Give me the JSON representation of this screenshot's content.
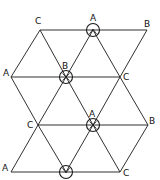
{
  "diagram": {
    "title": "",
    "type": "triangular-lattice",
    "nodes": [
      {
        "id": "r1a",
        "label": "C",
        "x": 40,
        "y": 30,
        "lx": 35,
        "ly": 24,
        "circled": false
      },
      {
        "id": "r1b",
        "label": "A",
        "x": 93,
        "y": 30,
        "lx": 90,
        "ly": 20,
        "circled": true,
        "mark": "caret-up"
      },
      {
        "id": "r1c",
        "label": "B",
        "x": 147,
        "y": 30,
        "lx": 145,
        "ly": 26,
        "circled": false
      },
      {
        "id": "r2a",
        "label": "A",
        "x": 11,
        "y": 77,
        "lx": 4,
        "ly": 74,
        "circled": false
      },
      {
        "id": "r2b",
        "label": "B",
        "x": 66,
        "y": 77,
        "lx": 63,
        "ly": 68,
        "circled": true,
        "mark": "cross"
      },
      {
        "id": "r2c",
        "label": "C",
        "x": 120,
        "y": 77,
        "lx": 124,
        "ly": 80,
        "circled": false
      },
      {
        "id": "r3a",
        "label": "C",
        "x": 38,
        "y": 125,
        "lx": 28,
        "ly": 128,
        "circled": false
      },
      {
        "id": "r3b",
        "label": "A",
        "x": 93,
        "y": 125,
        "lx": 90,
        "ly": 117,
        "circled": true,
        "mark": "cross"
      },
      {
        "id": "r3c",
        "label": "B",
        "x": 148,
        "y": 125,
        "lx": 149,
        "ly": 123,
        "circled": false
      },
      {
        "id": "r4a",
        "label": "A",
        "x": 11,
        "y": 172,
        "lx": 3,
        "ly": 170,
        "circled": false
      },
      {
        "id": "r4b",
        "label": "",
        "x": 66,
        "y": 172,
        "lx": 0,
        "ly": 0,
        "circled": true,
        "mark": "caret-down"
      },
      {
        "id": "r4c",
        "label": "C",
        "x": 120,
        "y": 172,
        "lx": 124,
        "ly": 175,
        "circled": false
      }
    ],
    "labels": {
      "r1a": "C",
      "r1b": "A",
      "r1c": "B",
      "r2a": "A",
      "r2b": "B",
      "r2c": "C",
      "r3a": "C",
      "r3b": "A",
      "r3c": "B",
      "r4a": "A",
      "r4c": "C"
    },
    "edges": [
      [
        "r1a",
        "r1c"
      ],
      [
        "r2a",
        "r2c"
      ],
      [
        "r3a",
        "r3c"
      ],
      [
        "r4a",
        "r4c"
      ],
      [
        "r1a",
        "r2a"
      ],
      [
        "r1a",
        "r2b"
      ],
      [
        "r1b",
        "r2b"
      ],
      [
        "r1b",
        "r2c"
      ],
      [
        "r1c",
        "r2c"
      ],
      [
        "r2a",
        "r3a"
      ],
      [
        "r2b",
        "r3a"
      ],
      [
        "r2b",
        "r3b"
      ],
      [
        "r2c",
        "r3b"
      ],
      [
        "r2c",
        "r3c"
      ],
      [
        "r3a",
        "r4a"
      ],
      [
        "r3a",
        "r4b"
      ],
      [
        "r3b",
        "r4b"
      ],
      [
        "r3b",
        "r4c"
      ],
      [
        "r3c",
        "r4c"
      ]
    ],
    "colors": {
      "line": "#1a1a1a",
      "background": "#ffffff"
    }
  }
}
